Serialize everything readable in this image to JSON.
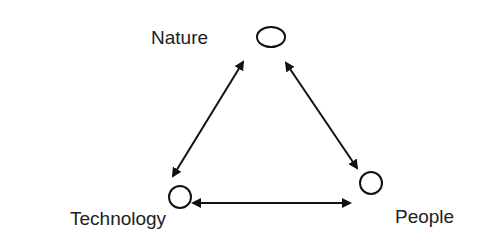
{
  "diagram": {
    "nodes": [
      {
        "id": "nature",
        "label": "Nature"
      },
      {
        "id": "technology",
        "label": "Technology"
      },
      {
        "id": "people",
        "label": "People"
      }
    ],
    "edges": [
      {
        "from": "nature",
        "to": "technology",
        "direction": "both"
      },
      {
        "from": "nature",
        "to": "people",
        "direction": "both"
      },
      {
        "from": "technology",
        "to": "people",
        "direction": "both"
      }
    ]
  }
}
